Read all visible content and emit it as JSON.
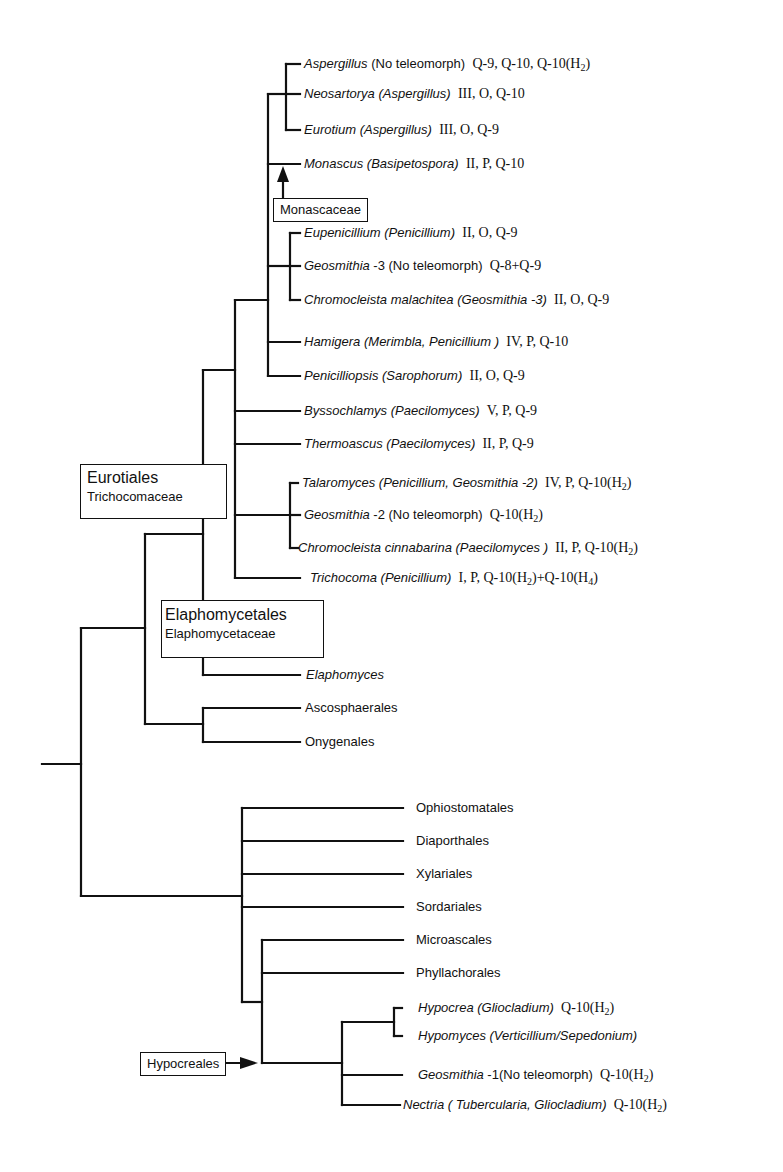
{
  "figure": {
    "type": "phylogenetic-tree",
    "line_color": "#111111",
    "background": "#ffffff"
  },
  "group_boxes": {
    "monascaceae": {
      "label": "Monascaceae"
    },
    "eurotiales": {
      "order": "Eurotiales",
      "family": "Trichocomaceae"
    },
    "elaphomycetales": {
      "order": "Elaphomycetales",
      "family": "Elaphomycetaceae"
    },
    "hypocreales": {
      "label": "Hypocreales"
    }
  },
  "taxa": [
    {
      "id": "aspergillus",
      "genus": "Aspergillus",
      "anamorph": " (No teleomorph)",
      "anamorph_italic": false,
      "traits": "Q-9, Q-10, Q-10(H",
      "sub": "2",
      "tail": ")"
    },
    {
      "id": "neosartorya",
      "genus": "Neosartorya",
      "anamorph": " (Aspergillus)",
      "anamorph_italic": true,
      "traits": "III, O, Q-10"
    },
    {
      "id": "eurotium",
      "genus": "Eurotium",
      "anamorph": "  (Aspergillus)",
      "anamorph_italic": true,
      "traits": "III, O, Q-9"
    },
    {
      "id": "monascus",
      "genus": "Monascus",
      "anamorph": " (Basipetospora)",
      "anamorph_italic": true,
      "traits": "II, P, Q-10"
    },
    {
      "id": "eupenicillium",
      "genus": "Eupenicillium",
      "anamorph": " (Penicillium)",
      "anamorph_italic": true,
      "traits": "II, O, Q-9"
    },
    {
      "id": "geosmithia-3",
      "genus": "Geosmithia",
      "anamorph": " -3 (No teleomorph)",
      "anamorph_italic": false,
      "traits": "Q-8+Q-9"
    },
    {
      "id": "chromocleista-malachitea",
      "genus": "Chromocleista malachitea",
      "anamorph": "  (Geosmithia -3)",
      "anamorph_italic": true,
      "traits": "II, O, Q-9"
    },
    {
      "id": "hamigera",
      "genus": "Hamigera",
      "anamorph": " (Merimbla, Penicillium )",
      "anamorph_italic": true,
      "traits": "IV, P, Q-10"
    },
    {
      "id": "penicilliopsis",
      "genus": "Penicilliopsis",
      "anamorph": " (Sarophorum)",
      "anamorph_italic": true,
      "traits": "II, O, Q-9"
    },
    {
      "id": "byssochlamys",
      "genus": "Byssochlamys",
      "anamorph": " (Paecilomyces)",
      "anamorph_italic": true,
      "traits": "V, P, Q-9"
    },
    {
      "id": "thermoascus",
      "genus": "Thermoascus",
      "anamorph": "  (Paecilomyces)",
      "anamorph_italic": true,
      "traits": "II, P, Q-9"
    },
    {
      "id": "talaromyces",
      "genus": "Talaromyces",
      "anamorph": "  (Penicillium, Geosmithia -2)",
      "anamorph_italic": true,
      "traits": "IV, P, Q-10(H",
      "sub": "2",
      "tail": ")"
    },
    {
      "id": "geosmithia-2",
      "genus": "Geosmithia",
      "anamorph": " -2 (No teleomorph)",
      "anamorph_italic": false,
      "traits": "Q-10(H",
      "sub": "2",
      "tail": ")"
    },
    {
      "id": "chromocleista-cinnabarina",
      "genus": "Chromocleista cinnabarina",
      "anamorph": " (Paecilomyces )",
      "anamorph_italic": true,
      "traits": "II, P, Q-10(H",
      "sub": "2",
      "tail": ")"
    },
    {
      "id": "trichocoma",
      "genus": "Trichocoma",
      "anamorph": "  (Penicillium)",
      "anamorph_italic": true,
      "traits": "I, P, Q-10(H",
      "sub": "2",
      "tail": ")+Q-10(H",
      "sub2": "4",
      "tail2": ")"
    },
    {
      "id": "elaphomyces",
      "genus": "Elaphomyces",
      "anamorph": "",
      "anamorph_italic": false,
      "traits": ""
    },
    {
      "id": "ascosphaerales",
      "plain": "Ascosphaerales"
    },
    {
      "id": "onygenales",
      "plain": "Onygenales"
    },
    {
      "id": "ophiostomatales",
      "plain": "Ophiostomatales"
    },
    {
      "id": "diaporthales",
      "plain": "Diaporthales"
    },
    {
      "id": "xylariales",
      "plain": "Xylariales"
    },
    {
      "id": "sordariales",
      "plain": "Sordariales"
    },
    {
      "id": "microascales",
      "plain": "Microascales"
    },
    {
      "id": "phyllachorales",
      "plain": "Phyllachorales"
    },
    {
      "id": "hypocrea",
      "genus": "Hypocrea",
      "anamorph": " (Gliocladium)",
      "anamorph_italic": true,
      "traits": "Q-10(H",
      "sub": "2",
      "tail": ")"
    },
    {
      "id": "hypomyces",
      "genus": "Hypomyces",
      "anamorph": " (Verticillium/Sepedonium)",
      "anamorph_italic": true,
      "traits": ""
    },
    {
      "id": "geosmithia-1",
      "genus": "Geosmithia",
      "anamorph": " -1(No teleomorph)",
      "anamorph_italic": false,
      "traits": "Q-10(H",
      "sub": "2",
      "tail": ")"
    },
    {
      "id": "nectria",
      "genus": "Nectria",
      "anamorph": " ( Tubercularia, Gliocladium)",
      "anamorph_italic": true,
      "traits": "Q-10(H",
      "sub": "2",
      "tail": ")"
    }
  ]
}
